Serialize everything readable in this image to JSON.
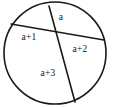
{
  "figure": {
    "kind": "circle-divided-by-two-chords",
    "stroke_color": "#1a1a1a",
    "fill_color": "#ffffff",
    "background_color": "#ffffff",
    "circle": {
      "center_x": 55,
      "center_y": 53,
      "radius": 51,
      "stroke_width": 1.6
    },
    "chords": [
      {
        "name": "chord-upper-left-to-right",
        "x1": 11,
        "y1": 24,
        "x2": 104,
        "y2": 40,
        "stroke_width": 1.4
      },
      {
        "name": "chord-top-to-bottom",
        "x1": 49,
        "y1": 6,
        "x2": 75,
        "y2": 102,
        "stroke_width": 1.6
      }
    ],
    "intersection": {
      "x": 57,
      "y": 36
    },
    "regions": [
      {
        "id": "top",
        "label": "a",
        "x": 61,
        "y": 18
      },
      {
        "id": "left",
        "label": "a+1",
        "x": 29,
        "y": 38
      },
      {
        "id": "right",
        "label": "a+2",
        "x": 80,
        "y": 50
      },
      {
        "id": "bottom",
        "label": "a+3",
        "x": 48,
        "y": 74
      }
    ]
  }
}
